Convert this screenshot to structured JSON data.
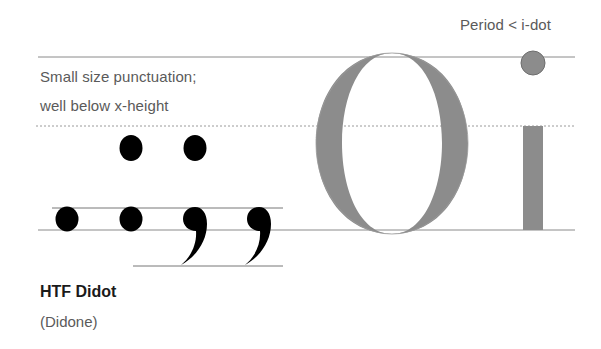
{
  "annotations": {
    "period_vs_idot": "Period < i-dot",
    "small_punct_line1": "Small size punctuation;",
    "small_punct_line2": "well below x-height"
  },
  "typeface": {
    "name": "HTF Didot",
    "classification": "(Didone)"
  },
  "specimen": {
    "glyphs": [
      "O",
      "i"
    ],
    "punctuation": [
      ":",
      ":",
      ";",
      ";"
    ]
  },
  "colors": {
    "glyph_gray": "#8c8c8c",
    "punct_black": "#000000",
    "guide_line": "#888888",
    "text": "#5a5a5a"
  }
}
